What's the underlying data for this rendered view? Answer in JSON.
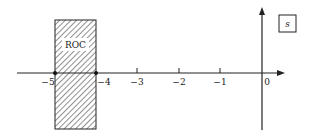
{
  "diagram": {
    "plane_label": "s",
    "roc_label": "ROC",
    "roc_range": [
      -5,
      -4
    ],
    "axis_ticks": [
      {
        "value": -5,
        "label": "−5"
      },
      {
        "value": -4,
        "label": "−4"
      },
      {
        "value": -3,
        "label": "−3"
      },
      {
        "value": -2,
        "label": "−2"
      },
      {
        "value": -1,
        "label": "−1"
      },
      {
        "value": 0,
        "label": "0"
      }
    ],
    "poles_marked": [
      -5,
      -4
    ]
  }
}
